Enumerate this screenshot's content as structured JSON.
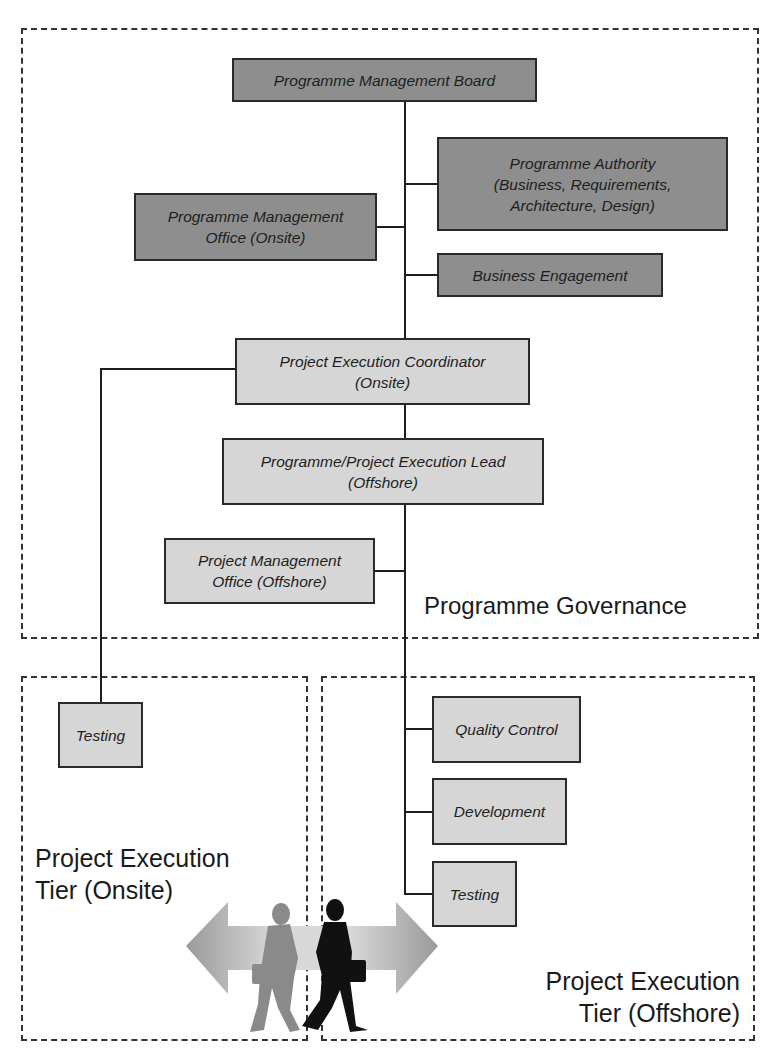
{
  "diagram": {
    "colors": {
      "governance_box_fill": "#8e8e8e",
      "execution_box_fill": "#d6d6d6",
      "line_color": "#1e1e1e",
      "frame_dash_color": "#333333"
    },
    "regions": {
      "governance": {
        "label": "Programme Governance"
      },
      "onsite": {
        "label": "Project Execution\nTier (Onsite)"
      },
      "offshore": {
        "label": "Project Execution\nTier (Offshore)"
      }
    },
    "nodes": {
      "programme_management_board": "Programme Management Board",
      "programme_authority": "Programme Authority\n(Business, Requirements,\nArchitecture, Design)",
      "programme_management_office_onsite": "Programme Management\nOffice (Onsite)",
      "business_engagement": "Business Engagement",
      "project_execution_coordinator": "Project Execution Coordinator\n(Onsite)",
      "execution_lead_offshore": "Programme/Project Execution Lead\n(Offshore)",
      "project_management_office_offshore": "Project Management\nOffice (Offshore)",
      "testing_onsite": "Testing",
      "quality_control": "Quality Control",
      "development": "Development",
      "testing_offshore": "Testing"
    },
    "graphic": {
      "icon": "walking-businessmen-double-arrow-icon"
    }
  }
}
